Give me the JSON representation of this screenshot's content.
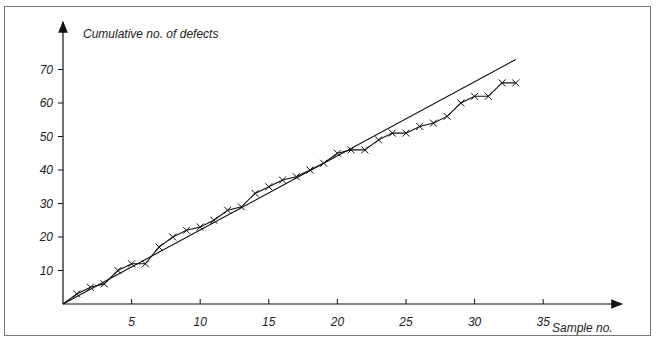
{
  "chart_data": {
    "type": "line",
    "title": "",
    "ylabel": "Cumulative no. of defects",
    "xlabel": "Sample no.",
    "x_ticks": [
      5,
      10,
      15,
      20,
      25,
      30,
      35
    ],
    "y_ticks": [
      10,
      20,
      30,
      40,
      50,
      60,
      70
    ],
    "xlim": [
      0,
      38
    ],
    "ylim": [
      0,
      78
    ],
    "grid": false,
    "legend": null,
    "series": [
      {
        "name": "Cumulative defects",
        "marker": "x",
        "x": [
          1,
          2,
          3,
          4,
          5,
          6,
          7,
          8,
          9,
          10,
          11,
          12,
          13,
          14,
          15,
          16,
          17,
          18,
          19,
          20,
          21,
          22,
          23,
          24,
          25,
          26,
          27,
          28,
          29,
          30,
          31,
          32,
          33
        ],
        "values": [
          3,
          5,
          6,
          10,
          12,
          12,
          17,
          20,
          22,
          23,
          25,
          28,
          29,
          33,
          35,
          37,
          38,
          40,
          42,
          45,
          46,
          46,
          49,
          51,
          51,
          53,
          54,
          56,
          60,
          62,
          62,
          66,
          66
        ]
      },
      {
        "name": "Reference line",
        "marker": "none",
        "x": [
          0,
          33
        ],
        "values": [
          0,
          73
        ]
      }
    ]
  }
}
